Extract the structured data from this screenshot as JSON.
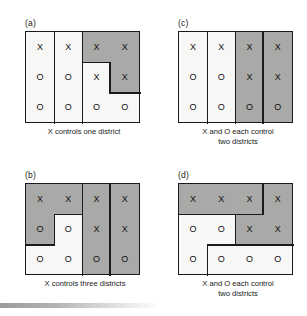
{
  "figure": {
    "panels": [
      {
        "label": "(a)",
        "caption": "X controls one district",
        "grid": [
          [
            "X",
            "X",
            "X",
            "X"
          ],
          [
            "O",
            "O",
            "X",
            "X"
          ],
          [
            "O",
            "O",
            "O",
            "O"
          ]
        ],
        "shaded_cells": [
          "0-2",
          "0-3",
          "1-3"
        ],
        "districts": 3,
        "result": "X controls one district"
      },
      {
        "label": "(c)",
        "caption_line1": "X and O each control",
        "caption_line2": "two districts",
        "grid": [
          [
            "X",
            "X",
            "X",
            "X"
          ],
          [
            "O",
            "O",
            "X",
            "X"
          ],
          [
            "O",
            "O",
            "O",
            "O"
          ]
        ],
        "shaded_cells": [
          "0-2",
          "0-3",
          "1-2",
          "1-3",
          "2-2",
          "2-3"
        ],
        "districts": 4,
        "result": "X and O each control two districts"
      },
      {
        "label": "(b)",
        "caption": "X controls three districts",
        "grid": [
          [
            "X",
            "X",
            "X",
            "X"
          ],
          [
            "O",
            "O",
            "X",
            "X"
          ],
          [
            "O",
            "O",
            "O",
            "O"
          ]
        ],
        "shaded_cells": [
          "0-0",
          "0-1",
          "1-0",
          "0-2",
          "1-2",
          "2-2",
          "0-3",
          "1-3",
          "2-3"
        ],
        "districts": 4,
        "result": "X controls three districts"
      },
      {
        "label": "(d)",
        "caption_line1": "X and O each control",
        "caption_line2": "two districts",
        "grid": [
          [
            "X",
            "X",
            "X",
            "X"
          ],
          [
            "O",
            "O",
            "X",
            "X"
          ],
          [
            "O",
            "O",
            "O",
            "O"
          ]
        ],
        "shaded_cells": [
          "0-0",
          "0-1",
          "0-2",
          "0-3",
          "1-2",
          "1-3"
        ],
        "districts": 4,
        "result": "X and O each control two districts"
      }
    ],
    "colors": {
      "shaded": "#a9a9a7",
      "light": "#f7f7f5",
      "border": "#1a1a1a",
      "background": "#ffffff"
    },
    "symbols": {
      "x": "X",
      "o": "O"
    }
  }
}
